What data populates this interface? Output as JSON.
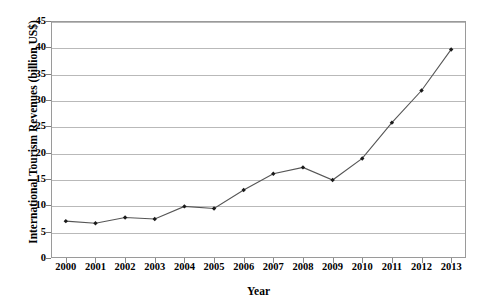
{
  "chart_data": {
    "type": "line",
    "title": "",
    "xlabel": "Year",
    "ylabel": "International Tourism Revenues (billion US$)",
    "categories": [
      "2000",
      "2001",
      "2002",
      "2003",
      "2004",
      "2005",
      "2006",
      "2007",
      "2008",
      "2009",
      "2010",
      "2011",
      "2012",
      "2013"
    ],
    "values": [
      7.0,
      6.6,
      7.7,
      7.4,
      9.8,
      9.4,
      12.9,
      16.0,
      17.2,
      14.8,
      18.9,
      25.7,
      31.8,
      39.6
    ],
    "series": [
      {
        "name": "International Tourism Revenues",
        "values": [
          7.0,
          6.6,
          7.7,
          7.4,
          9.8,
          9.4,
          12.9,
          16.0,
          17.2,
          14.8,
          18.9,
          25.7,
          31.8,
          39.6
        ]
      }
    ],
    "ylim": [
      0,
      45
    ],
    "yticks": [
      0,
      5,
      10,
      15,
      20,
      25,
      30,
      35,
      40,
      45
    ],
    "ytick_labels": [
      "0",
      "5",
      "10",
      "15",
      "20",
      "25",
      "30",
      "35",
      "40",
      "45"
    ],
    "xtick_labels": [
      "2000",
      "2001",
      "2002",
      "2003",
      "2004",
      "2005",
      "2006",
      "2007",
      "2008",
      "2009",
      "2010",
      "2011",
      "2012",
      "2013"
    ],
    "grid": "horizontal",
    "legend": "none",
    "marker": "diamond",
    "line_color": "#555555",
    "marker_color": "#1a1a1a",
    "grid_color": "#b9b9b9",
    "axis_color": "#9a9a9a",
    "background_color": "#ffffff"
  },
  "axes": {
    "y_title": "International Tourism Revenues (billion US$)",
    "x_title": "Year"
  }
}
